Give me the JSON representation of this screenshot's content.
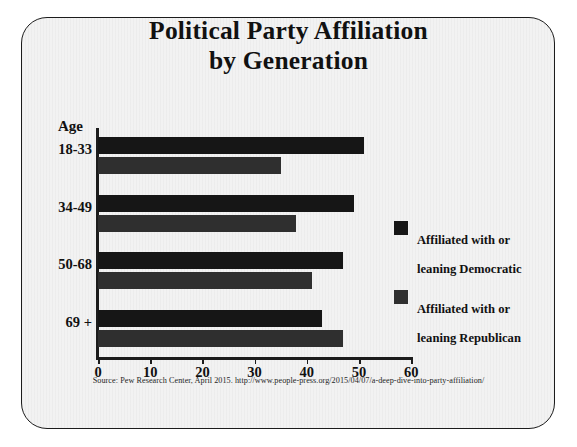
{
  "figure": {
    "title_line1": "Political Party Affiliation",
    "title_line2": "by Generation",
    "category_axis_header": "Age",
    "source_note": "Source: Pew Research Center, April 2015. http://www.people-press.org/2015/04/07/a-deep-dive-into-party-affiliation/",
    "colors": {
      "democratic": "#161616",
      "republican": "#2f2f2f",
      "frame": "#1c1c1c",
      "background": "#f2f2f2",
      "page": "#ffffff"
    }
  },
  "chart_data": {
    "type": "bar",
    "orientation": "horizontal",
    "title": "Political Party Affiliation by Generation",
    "xlabel": "",
    "ylabel": "Age",
    "xlim": [
      0,
      60
    ],
    "xticks": [
      0,
      10,
      20,
      30,
      40,
      50,
      60
    ],
    "categories": [
      "18-33",
      "34-49",
      "50-68",
      "69 +"
    ],
    "grid": false,
    "legend_position": "right",
    "series": [
      {
        "name": "Affiliated with or leaning Democratic",
        "label_line1": "Affiliated with or",
        "label_line2": "leaning Democratic",
        "color": "#161616",
        "values": [
          51,
          49,
          47,
          43
        ]
      },
      {
        "name": "Affiliated with or leaning Republican",
        "label_line1": "Affiliated with or",
        "label_line2": "leaning Republican",
        "color": "#2f2f2f",
        "values": [
          35,
          38,
          41,
          47
        ]
      }
    ]
  }
}
